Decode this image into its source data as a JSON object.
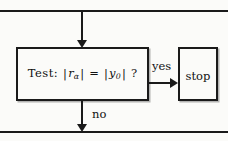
{
  "diagram": {
    "background_color": "#fbfbf9",
    "line_color": "#1a1a1a",
    "nodes": [
      {
        "id": "test",
        "type": "decision",
        "label_prefix": "Test:",
        "expression": "| r_alpha | = | y_0 | ?",
        "parts": {
          "prefix": "Test:",
          "bar_open_1": "|",
          "var_1": "r",
          "sub_1": "α",
          "bar_close_1": "|",
          "equals": "=",
          "bar_open_2": "|",
          "var_2": "y",
          "sub_2": "0",
          "bar_close_2": "|",
          "question": "?"
        }
      },
      {
        "id": "stop",
        "type": "terminal",
        "label": "stop"
      }
    ],
    "edges": [
      {
        "id": "edge-in",
        "from": "top-rule",
        "to": "test",
        "label": "",
        "direction": "down"
      },
      {
        "id": "edge-yes",
        "from": "test",
        "to": "stop",
        "label": "yes",
        "direction": "right"
      },
      {
        "id": "edge-no",
        "from": "test",
        "to": "bottom-rule",
        "label": "no",
        "direction": "down"
      }
    ]
  }
}
